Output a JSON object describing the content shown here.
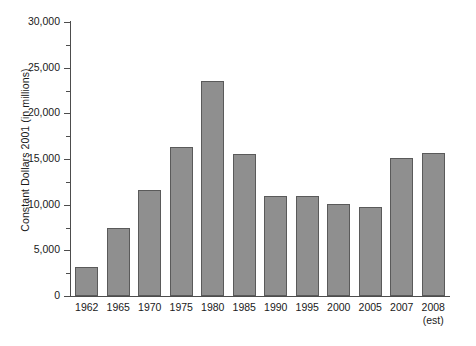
{
  "chart_data": {
    "type": "bar",
    "title": "",
    "xlabel": "",
    "ylabel": "Constant Dollars 2001 (in millions)",
    "ylim": [
      0,
      30000
    ],
    "ytick_values": [
      0,
      5000,
      10000,
      15000,
      20000,
      25000,
      30000
    ],
    "ytick_labels": [
      "0",
      "5,000",
      "10,000",
      "15,000",
      "20,000",
      "25,000",
      "30,000"
    ],
    "yminor_tick_values": [
      2500,
      7500,
      12500,
      17500,
      22500,
      27500
    ],
    "grid": false,
    "legend": "none",
    "bar_color": "#8f8f8f",
    "bar_edge_color": "#5a5a5a",
    "axis_color": "#4d4d4d",
    "categories": [
      "1962",
      "1965",
      "1970",
      "1975",
      "1980",
      "1985",
      "1990",
      "1995",
      "2000",
      "2005",
      "2007",
      "2008"
    ],
    "category_sublabels": [
      "",
      "",
      "",
      "",
      "",
      "",
      "",
      "",
      "",
      "",
      "",
      "(est)"
    ],
    "values": [
      3200,
      7500,
      11600,
      16300,
      23500,
      15600,
      10900,
      10900,
      10100,
      9700,
      15100,
      15700
    ]
  }
}
